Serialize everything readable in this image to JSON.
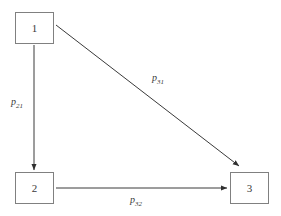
{
  "diagram": {
    "type": "directed-graph",
    "background_color": "#ffffff",
    "stroke_color": "#3a3a3a",
    "box_border_color": "#808080",
    "nodes": [
      {
        "id": "1",
        "label": "1",
        "x": 15,
        "y": 12,
        "width": 39,
        "height": 32
      },
      {
        "id": "2",
        "label": "2",
        "x": 15,
        "y": 172,
        "width": 39,
        "height": 32
      },
      {
        "id": "3",
        "label": "3",
        "x": 230,
        "y": 172,
        "width": 39,
        "height": 32
      }
    ],
    "edges": [
      {
        "id": "edge-1-2",
        "from": "1",
        "to": "2",
        "label_base": "p",
        "label_sub": "21",
        "label_text": "p21",
        "orientation": "vertical",
        "x1": 34,
        "y1": 45,
        "x2": 34,
        "y2": 170
      },
      {
        "id": "edge-1-3",
        "from": "1",
        "to": "3",
        "label_base": "p",
        "label_sub": "31",
        "label_text": "p31",
        "orientation": "diagonal",
        "x1": 56,
        "y1": 25,
        "x2": 240,
        "y2": 167
      },
      {
        "id": "edge-2-3",
        "from": "2",
        "to": "3",
        "label_base": "p",
        "label_sub": "32",
        "label_text": "p32",
        "orientation": "horizontal",
        "x1": 56,
        "y1": 188,
        "x2": 228,
        "y2": 188
      }
    ]
  }
}
